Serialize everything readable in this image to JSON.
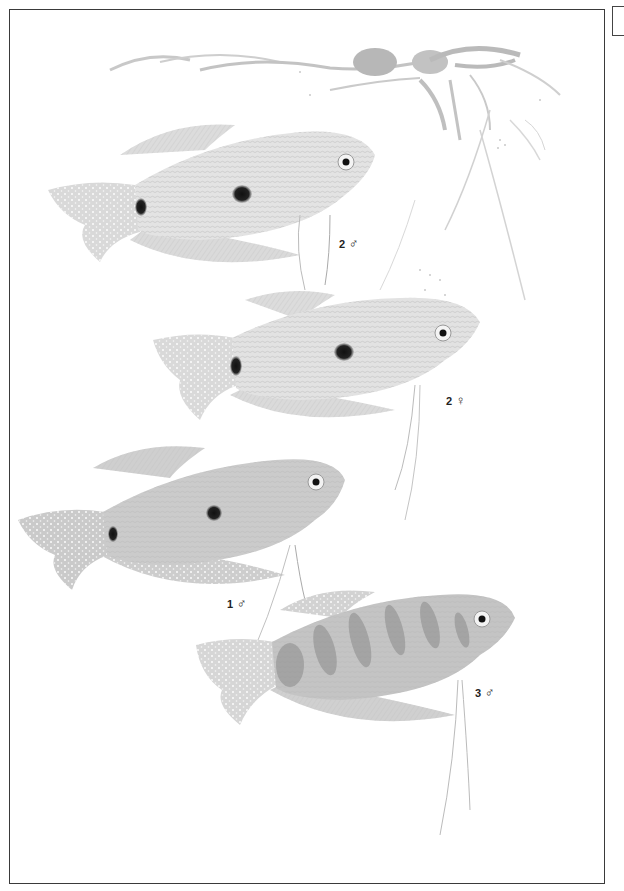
{
  "plate": {
    "subject": "Gourami illustration plate",
    "figures": [
      {
        "id": "fig-2-male",
        "number": "2",
        "sex_symbol": "♂",
        "sex": "male",
        "pattern": "two-spot, pale silver"
      },
      {
        "id": "fig-2-female",
        "number": "2",
        "sex_symbol": "♀",
        "sex": "female",
        "pattern": "two-spot, pale silver"
      },
      {
        "id": "fig-1-male",
        "number": "1",
        "sex_symbol": "♂",
        "sex": "male",
        "pattern": "two-spot, speckled blue-grey"
      },
      {
        "id": "fig-3-male",
        "number": "3",
        "sex_symbol": "♂",
        "sex": "male",
        "pattern": "banded, marbled"
      }
    ]
  },
  "colors": {
    "frame": "#3a3a3a",
    "body_pale": "#e4e4e4",
    "body_mid": "#cfcfcf",
    "body_dark": "#bdbdbd",
    "spot": "#1a1a1a",
    "fin": "#d8d8d8",
    "plant": "#a9a9a9"
  }
}
